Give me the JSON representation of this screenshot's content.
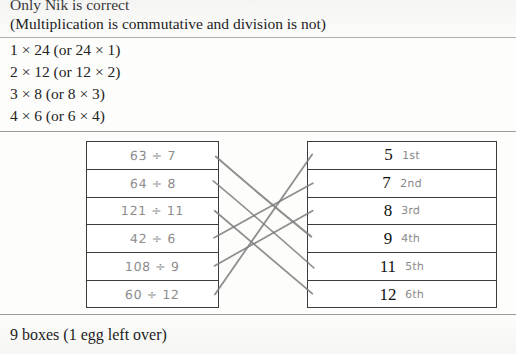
{
  "worksheet": {
    "top_lines": [
      "Only Nik is correct",
      "(Multiplication is commutative and division is not)"
    ],
    "factor_pairs": [
      "1 × 24 (or 24 × 1)",
      "2 × 12 (or 12 × 2)",
      "3 × 8 (or 8 × 3)",
      "4 × 6 (or 6 × 4)"
    ],
    "footer_line": "9 boxes (1 egg left over)"
  },
  "matching": {
    "left_column": {
      "name": "division-expressions",
      "cells": [
        {
          "text": "63 ÷ 7"
        },
        {
          "text": "64 ÷ 8"
        },
        {
          "text": "121 ÷ 11"
        },
        {
          "text": "42 ÷ 6"
        },
        {
          "text": "108 ÷ 9"
        },
        {
          "text": "60 ÷ 12"
        }
      ]
    },
    "right_column": {
      "name": "answer-values",
      "cells": [
        {
          "value": "5",
          "ordinal": "1st"
        },
        {
          "value": "7",
          "ordinal": "2nd"
        },
        {
          "value": "8",
          "ordinal": "3rd"
        },
        {
          "value": "9",
          "ordinal": "4th"
        },
        {
          "value": "11",
          "ordinal": "5th"
        },
        {
          "value": "12",
          "ordinal": "6th"
        }
      ]
    },
    "connections": [
      {
        "from_row": 1,
        "to_row": 4,
        "label": "63 ÷ 7 → 9"
      },
      {
        "from_row": 2,
        "to_row": 5,
        "label": "64 ÷ 8 → 11"
      },
      {
        "from_row": 3,
        "to_row": 6,
        "label": "121 ÷ 11 → 12"
      },
      {
        "from_row": 4,
        "to_row": 2,
        "label": "42 ÷ 6 → 7"
      },
      {
        "from_row": 5,
        "to_row": 3,
        "label": "108 ÷ 9 → 8"
      },
      {
        "from_row": 6,
        "to_row": 1,
        "label": "60 ÷ 12 → 5"
      }
    ],
    "ink_color": "#7b7b7b"
  }
}
